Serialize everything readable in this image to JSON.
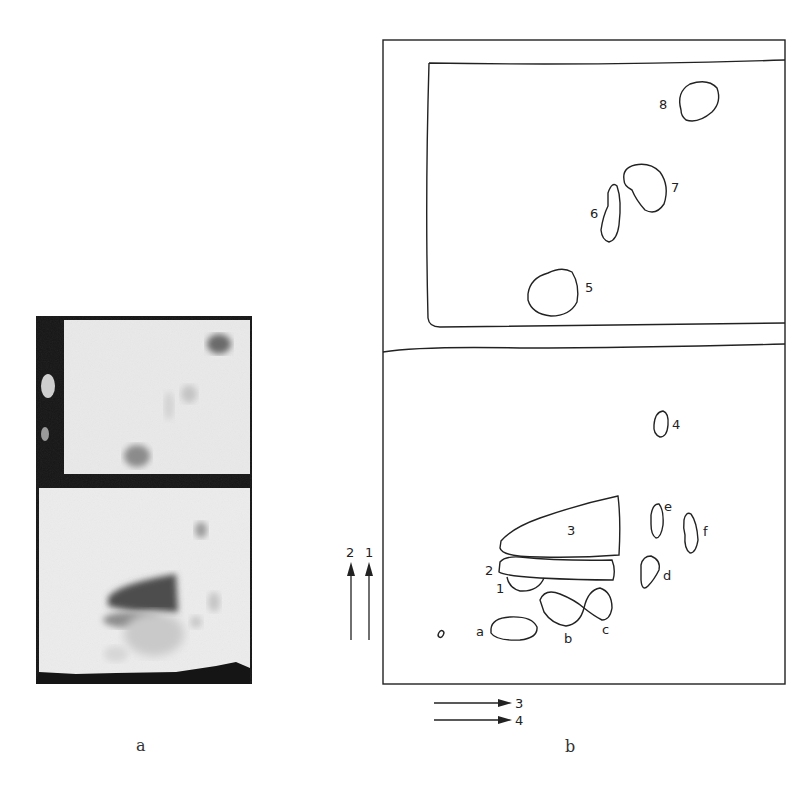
{
  "figure": {
    "panel_a": {
      "caption": "a",
      "description": "photograph of two-dimensional chromatogram (upper and lower plates)"
    },
    "panel_b": {
      "caption": "b",
      "description": "traced diagram of spots",
      "upper_spots": [
        {
          "label": "5"
        },
        {
          "label": "6"
        },
        {
          "label": "7"
        },
        {
          "label": "8"
        }
      ],
      "lower_spots": [
        {
          "label": "1"
        },
        {
          "label": "2"
        },
        {
          "label": "3"
        },
        {
          "label": "4"
        },
        {
          "label": "a"
        },
        {
          "label": "b"
        },
        {
          "label": "c"
        },
        {
          "label": "d"
        },
        {
          "label": "e"
        },
        {
          "label": "f"
        }
      ],
      "vertical_arrows": [
        {
          "label": "2"
        },
        {
          "label": "1"
        }
      ],
      "horizontal_arrows": [
        {
          "label": "3"
        },
        {
          "label": "4"
        }
      ]
    }
  },
  "colors": {
    "ink": "#222222",
    "photo_dark": "#151515",
    "photo_light": "#ececec"
  }
}
